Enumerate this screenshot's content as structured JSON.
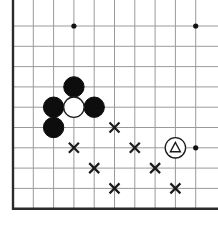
{
  "figure": {
    "kind": "go-board-diagram",
    "title": "",
    "width": 218,
    "height": 228,
    "background_color": "#ffffff"
  },
  "board": {
    "origin_x": 13,
    "origin_y": 26,
    "spacing": 20.3,
    "columns": 10,
    "rows": 10,
    "line_color": "#9a9a9a",
    "edge_color": "#2b2b2b",
    "edges": [
      "left",
      "bottom"
    ],
    "grid_visible": true,
    "star_point_color": "#111111",
    "star_point_radius": 2.6,
    "star_points": [
      {
        "col": 3,
        "row": 0
      },
      {
        "col": 9,
        "row": 0
      },
      {
        "col": 9,
        "row": 6
      }
    ]
  },
  "stones": {
    "radius": 10.2,
    "black_color": "#0d0d0d",
    "white_color": "#ffffff",
    "items": [
      {
        "color": "black",
        "col": 3,
        "row": 3,
        "label": ""
      },
      {
        "color": "black",
        "col": 2,
        "row": 4,
        "label": ""
      },
      {
        "color": "black",
        "col": 2,
        "row": 5,
        "label": ""
      },
      {
        "color": "black",
        "col": 4,
        "row": 4,
        "label": ""
      },
      {
        "color": "white",
        "col": 3,
        "row": 4,
        "label": ""
      },
      {
        "color": "white",
        "col": 8,
        "row": 6,
        "label": "triangle"
      }
    ]
  },
  "marks": {
    "x_color": "#1a1a1a",
    "x_half_size": 5.0,
    "x_items": [
      {
        "col": 5,
        "row": 5
      },
      {
        "col": 3,
        "row": 6
      },
      {
        "col": 6,
        "row": 6
      },
      {
        "col": 4,
        "row": 7
      },
      {
        "col": 7,
        "row": 7
      },
      {
        "col": 5,
        "row": 8
      },
      {
        "col": 8,
        "row": 8
      }
    ],
    "triangle_color": "#1a1a1a",
    "triangle_size": 5.4
  },
  "legend": {
    "triangle_glyph": "△",
    "x_glyph": "×",
    "black_stone_name": "black-stone",
    "white_stone_name": "white-stone",
    "marked_stone_name": "triangle-marked-white-stone"
  }
}
